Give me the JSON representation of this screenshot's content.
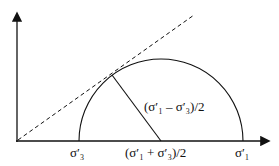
{
  "diagram": {
    "type": "Mohr circle with failure envelope",
    "labels": {
      "sigma3": "σ′₃",
      "sigma1": "σ′₁",
      "center": "(σ′₁ + σ′₃)/2",
      "radius": "(σ′₁ – σ′₃)/2"
    },
    "colors": {
      "line": "#111111",
      "background": "#ffffff"
    }
  }
}
